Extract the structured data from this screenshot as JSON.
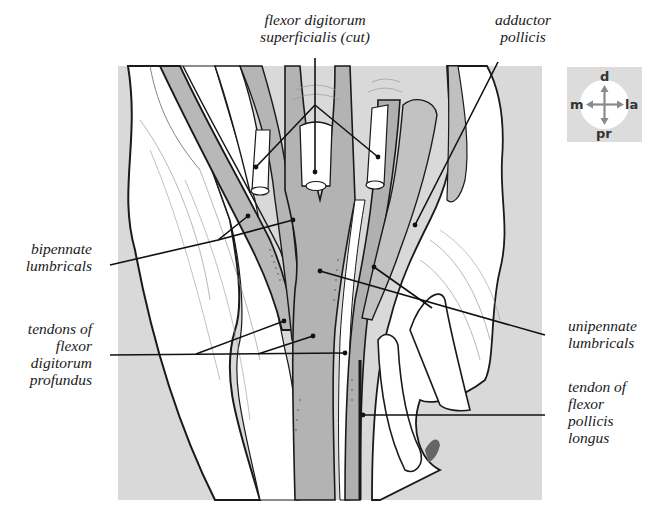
{
  "figure": {
    "colors": {
      "background_panel": "#d9d9d9",
      "tendon_gray": "#b3b3b3",
      "muscle_light": "#c8c8c8",
      "outline": "#1a1a1a",
      "paper": "#ffffff"
    }
  },
  "labels": {
    "fds": {
      "lines": [
        "flexor digitorum",
        "superficialis (cut)"
      ]
    },
    "adductor": {
      "lines": [
        "adductor",
        "pollicis"
      ]
    },
    "bipennate": {
      "lines": [
        "bipennate",
        "lumbricals"
      ]
    },
    "fdp": {
      "lines": [
        "tendons of",
        "flexor",
        "digitorum",
        "profundus"
      ]
    },
    "unipennate": {
      "lines": [
        "unipennate",
        "lumbricals"
      ]
    },
    "fpl": {
      "lines": [
        "tendon of",
        "flexor",
        "pollicis",
        "longus"
      ]
    }
  },
  "compass": {
    "up": "d",
    "down": "pr",
    "left": "m",
    "right": "la"
  }
}
